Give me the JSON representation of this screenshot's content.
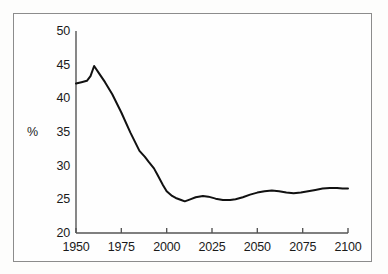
{
  "figure": {
    "background_color": "#fdfdfc",
    "frame_color": "#8c8c8c",
    "line_color": "#111111"
  },
  "axes": {
    "y_unit_label": "%",
    "y_ticks": [
      "50",
      "45",
      "40",
      "35",
      "30",
      "25",
      "20"
    ],
    "x_ticks": [
      "1950",
      "1975",
      "2000",
      "2025",
      "2050",
      "2075",
      "2100"
    ]
  },
  "chart_data": {
    "type": "line",
    "title": "",
    "subtitle": "",
    "xlabel": "",
    "ylabel": "%",
    "xlim": [
      1950,
      2100
    ],
    "ylim": [
      20,
      50
    ],
    "xticks": [
      1950,
      1975,
      2000,
      2025,
      2050,
      2075,
      2100
    ],
    "yticks": [
      20,
      25,
      30,
      35,
      40,
      45,
      50
    ],
    "grid": false,
    "legend": null,
    "legend_position": "none",
    "annotations": [],
    "series": [
      {
        "name": "share",
        "color": "#111111",
        "x": [
          1950,
          1953,
          1956,
          1958,
          1960,
          1963,
          1966,
          1970,
          1975,
          1980,
          1985,
          1988,
          1990,
          1993,
          1995,
          1998,
          2000,
          2003,
          2005,
          2008,
          2010,
          2013,
          2016,
          2020,
          2023,
          2027,
          2031,
          2035,
          2038,
          2042,
          2046,
          2050,
          2054,
          2058,
          2062,
          2066,
          2070,
          2074,
          2078,
          2082,
          2086,
          2090,
          2094,
          2097,
          2100
        ],
        "values": [
          42.2,
          42.4,
          42.6,
          43.3,
          44.8,
          43.6,
          42.4,
          40.6,
          37.9,
          34.9,
          32.2,
          31.3,
          30.6,
          29.6,
          28.6,
          27.1,
          26.2,
          25.5,
          25.2,
          24.9,
          24.7,
          25.0,
          25.3,
          25.5,
          25.4,
          25.1,
          24.9,
          24.9,
          25.0,
          25.3,
          25.7,
          26.0,
          26.2,
          26.3,
          26.2,
          26.0,
          25.9,
          26.0,
          26.2,
          26.4,
          26.6,
          26.7,
          26.7,
          26.6,
          26.6
        ]
      }
    ]
  }
}
